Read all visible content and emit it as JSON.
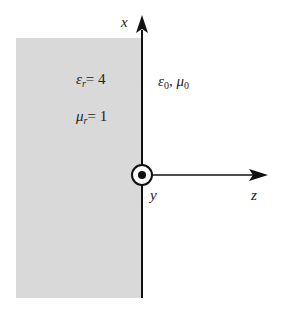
{
  "diagram": {
    "axes": {
      "x_label": "x",
      "y_label": "y",
      "z_label": "z"
    },
    "region_left": {
      "eps_symbol": "ε",
      "eps_sub": "r",
      "eps_value": "= 4",
      "mu_symbol": "μ",
      "mu_sub": "r",
      "mu_value": "= 1",
      "fill_color": "#d9d9d9"
    },
    "region_right": {
      "eps_symbol": "ε",
      "eps_sub": "0",
      "separator": ", ",
      "mu_symbol": "μ",
      "mu_sub": "0"
    },
    "y_axis_symbol": "out-of-page (dot in circle)"
  }
}
